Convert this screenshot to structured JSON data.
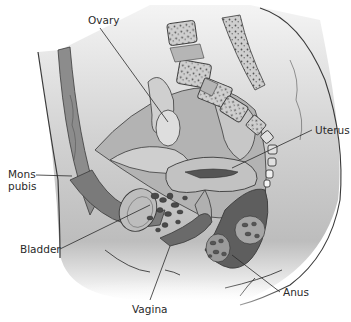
{
  "diagram": {
    "labels": {
      "ovary": "Ovary",
      "uterus": "Uterus",
      "mons_pubis_line1": "Mons",
      "mons_pubis_line2": "pubis",
      "bladder": "Bladder",
      "vagina": "Vagina",
      "anus": "Anus"
    },
    "colors": {
      "background": "#ffffff",
      "body_light": "#d9d9d9",
      "tissue_mid": "#a8a8a8",
      "tissue_dark": "#6e6e6e",
      "bone": "#ececec",
      "outline": "#3a3a3a"
    }
  }
}
